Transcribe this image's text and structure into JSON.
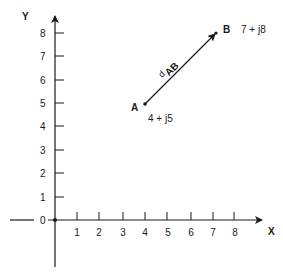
{
  "diagram": {
    "type": "complex-plane-vector",
    "axes": {
      "x_label": "X",
      "y_label": "Y",
      "origin_label": "0",
      "x_ticks": [
        "1",
        "2",
        "3",
        "4",
        "5",
        "6",
        "7",
        "8"
      ],
      "y_ticks": [
        "1",
        "2",
        "3",
        "4",
        "5",
        "6",
        "7",
        "8"
      ]
    },
    "points": [
      {
        "name": "A",
        "x": 4,
        "y": 5,
        "complex": "4 + j5"
      },
      {
        "name": "B",
        "x": 7,
        "y": 8,
        "complex": "7 + j8"
      }
    ],
    "vector": {
      "from": "A",
      "to": "B",
      "label_main": "d",
      "label_sub": "AB"
    },
    "colors": {
      "line": "#1a1a1a",
      "background": "#ffffff"
    }
  }
}
